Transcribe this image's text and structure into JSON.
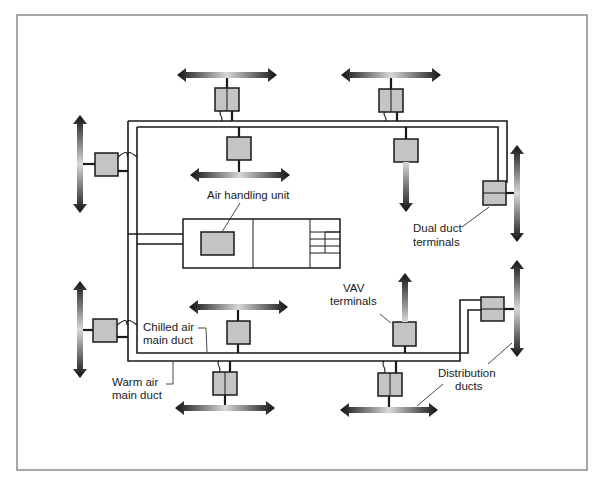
{
  "diagram": {
    "labels": {
      "air_handling_unit": "Air handling unit",
      "dual_duct_terminals_line1": "Dual duct",
      "dual_duct_terminals_line2": "terminals",
      "vav_terminals_line1": "VAV",
      "vav_terminals_line2": "terminals",
      "chilled_air_line1": "Chilled air",
      "chilled_air_line2": "main duct",
      "warm_air_line1": "Warm air",
      "warm_air_line2": "main duct",
      "distribution_ducts_line1": "Distribution",
      "distribution_ducts_line2": "ducts"
    },
    "components": {
      "main_ducts": [
        "Warm air main duct",
        "Chilled air main duct"
      ],
      "dual_duct_terminal_count": 6,
      "vav_terminal_count": 3,
      "distribution_duct_count": 9
    },
    "colors": {
      "terminal_fill": "#c4c4c4",
      "line": "#1a1a1a",
      "frame": "#8a8a8a",
      "arrow_dark": "#111111",
      "arrow_light": "#d8d8d8"
    }
  }
}
